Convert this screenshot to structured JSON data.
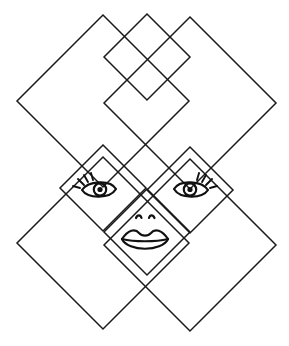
{
  "artwork": {
    "title": "Face in overlapping diamond lattice",
    "description": "Line drawing of a tiling of 45-degree rotated squares forming a diamond lattice, with a human face drawn into the central tiles",
    "background_color": "#ffffff",
    "line_color": "#1a1a1a",
    "face_line_color": "#111111",
    "line_width": 1.5,
    "canvas": {
      "width": 289,
      "height": 346
    }
  },
  "geometry": {
    "grid_type": "rotated-square-lattice",
    "cell_half_diagonal": 43,
    "center": {
      "x": 145,
      "y": 188
    },
    "key_vertices": {
      "top": {
        "x": 147,
        "y": 14
      },
      "left": {
        "x": 17,
        "y": 150
      },
      "right": {
        "x": 280,
        "y": 152
      },
      "bottom_left": {
        "x": 103,
        "y": 329
      },
      "bottom_right": {
        "x": 188,
        "y": 330
      }
    },
    "crossings": [
      {
        "x": 145,
        "y": 101,
        "label": "upper-center-crossing"
      },
      {
        "x": 59,
        "y": 194,
        "label": "left-crossing"
      },
      {
        "x": 145,
        "y": 188,
        "label": "center-crossing"
      },
      {
        "x": 234,
        "y": 194,
        "label": "right-crossing"
      },
      {
        "x": 145,
        "y": 288,
        "label": "lower-center-crossing"
      }
    ],
    "diamonds": [
      {
        "name": "top-diamond",
        "cx": 147,
        "cy": 57,
        "r": 43
      },
      {
        "name": "upper-left-diamond",
        "cx": 103,
        "cy": 101,
        "r": 86
      },
      {
        "name": "upper-right-diamond",
        "cx": 190,
        "cy": 103,
        "r": 86
      },
      {
        "name": "left-eye-diamond",
        "cx": 103,
        "cy": 188,
        "r": 43
      },
      {
        "name": "right-eye-diamond",
        "cx": 190,
        "cy": 190,
        "r": 43
      },
      {
        "name": "mouth-diamond",
        "cx": 147,
        "cy": 232,
        "r": 43
      },
      {
        "name": "lower-left-diamond",
        "cx": 103,
        "cy": 243,
        "r": 86
      },
      {
        "name": "lower-right-diamond",
        "cx": 190,
        "cy": 245,
        "r": 86
      }
    ]
  },
  "face": {
    "label": "face",
    "features": [
      {
        "name": "left-eye",
        "type": "eye",
        "center": {
          "x": 99,
          "y": 190
        },
        "width": 34,
        "height": 16,
        "pupil_radius": 4.2,
        "lash_side": "left",
        "lash_count": 4
      },
      {
        "name": "right-eye",
        "type": "eye",
        "center": {
          "x": 191,
          "y": 190
        },
        "width": 34,
        "height": 16,
        "pupil_radius": 4.2,
        "lash_side": "right",
        "lash_count": 4
      },
      {
        "name": "nose",
        "type": "nostrils",
        "center": {
          "x": 145,
          "y": 218
        },
        "nostril_offset": 7
      },
      {
        "name": "mouth",
        "type": "lips",
        "center": {
          "x": 145,
          "y": 240
        },
        "width": 44,
        "height": 20
      }
    ]
  }
}
